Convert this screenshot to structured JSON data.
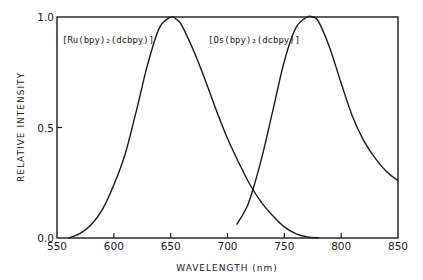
{
  "chart_data": {
    "type": "line",
    "title": "",
    "xlabel": "WAVELENGTH (nm)",
    "ylabel": "RELATIVE INTENSITY",
    "xlim": [
      550,
      850
    ],
    "ylim": [
      0.0,
      1.0
    ],
    "xticks": [
      "550",
      "600",
      "650",
      "700",
      "750",
      "800",
      "850"
    ],
    "yticks": [
      "0.0",
      "0.5",
      "1.0"
    ],
    "grid": false,
    "series": [
      {
        "name": "[Ru(bpy)2(dcbpy)]",
        "label_display": "[Ru(bpy)₂(dcbpy)]",
        "x": [
          560,
          570,
          580,
          590,
          600,
          610,
          620,
          630,
          640,
          650,
          655,
          660,
          670,
          680,
          690,
          700,
          710,
          720,
          730,
          740,
          750,
          760,
          770,
          780
        ],
        "y": [
          0.0,
          0.02,
          0.06,
          0.13,
          0.24,
          0.38,
          0.58,
          0.79,
          0.95,
          1.0,
          0.99,
          0.96,
          0.85,
          0.72,
          0.58,
          0.45,
          0.34,
          0.24,
          0.16,
          0.1,
          0.05,
          0.02,
          0.005,
          0.0
        ]
      },
      {
        "name": "[Os(bpy)2(dcbpy)]",
        "label_display": "[Os(bpy)₂(dcbpy)]",
        "x": [
          708,
          715,
          720,
          730,
          740,
          750,
          760,
          770,
          775,
          780,
          790,
          800,
          810,
          820,
          830,
          840,
          850
        ],
        "y": [
          0.06,
          0.12,
          0.18,
          0.36,
          0.58,
          0.8,
          0.95,
          1.0,
          1.0,
          0.98,
          0.86,
          0.7,
          0.55,
          0.44,
          0.36,
          0.3,
          0.26
        ]
      }
    ],
    "legend_position": "inline labels near top of each curve"
  },
  "plot": {
    "left": 57,
    "right": 398,
    "top": 17,
    "bottom": 238,
    "line_color": "#1a1a1a"
  },
  "labels": {
    "ru": "[Ru(bpy)₂(dcbpy)]",
    "os": "[Os(bpy)₂(dcbpy)]",
    "xlabel": "WAVELENGTH (nm)",
    "ylabel": "RELATIVE INTENSITY"
  }
}
